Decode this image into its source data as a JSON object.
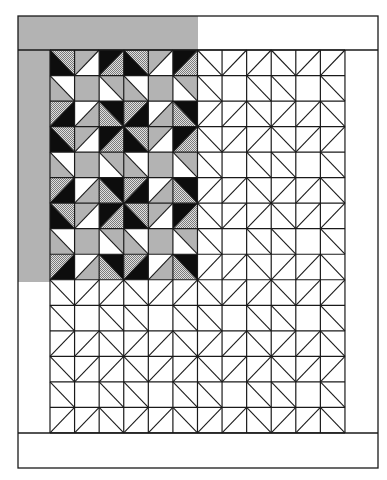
{
  "diagram": {
    "type": "quilt-layout",
    "colors": {
      "background": "#ffffff",
      "line": "#1a1a1a",
      "gray": "#b3b3b3",
      "black": "#0d0d0d",
      "white": "#ffffff",
      "dot_light": "#e0e0e0",
      "dot_dark": "#7a7a7a"
    },
    "frame": {
      "x": 18,
      "y": 16,
      "width": 360,
      "height": 452
    },
    "borders": {
      "top": {
        "y1": 16,
        "y2": 50
      },
      "bottom": {
        "y1": 433,
        "y2": 468
      },
      "left": {
        "x1": 18,
        "x2": 50
      },
      "right": {
        "x1": 345,
        "x2": 378
      },
      "top_colored_until_x": 198,
      "left_colored_until_y": 282
    },
    "grid": {
      "x": 50,
      "y": 50,
      "cols": 12,
      "rows": 15,
      "cell_w": 24.58,
      "cell_h": 25.53,
      "colored_cols": 6,
      "colored_rows": 9
    },
    "pattern_note": "3x3 repeating block; each cell = diagonal + two triangle fills",
    "block": [
      [
        {
          "diag": "\\",
          "a": "dot",
          "b": "black"
        },
        {
          "diag": "/",
          "a": "gray",
          "b": "white"
        },
        {
          "diag": "/",
          "a": "black",
          "b": "dot"
        }
      ],
      [
        {
          "diag": "\\",
          "a": "white",
          "b": "gray"
        },
        {
          "diag": "none",
          "a": "gray",
          "b": "gray"
        },
        {
          "diag": "\\",
          "a": "gray",
          "b": "white"
        }
      ],
      [
        {
          "diag": "/",
          "a": "dot",
          "b": "black"
        },
        {
          "diag": "/",
          "a": "white",
          "b": "gray"
        },
        {
          "diag": "\\",
          "a": "black",
          "b": "dot"
        }
      ]
    ],
    "legend": {
      "a_meaning_for_backslash": "upper-right triangle",
      "b_meaning_for_backslash": "lower-left triangle",
      "a_meaning_for_slash": "upper-left triangle",
      "b_meaning_for_slash": "lower-right triangle"
    }
  }
}
